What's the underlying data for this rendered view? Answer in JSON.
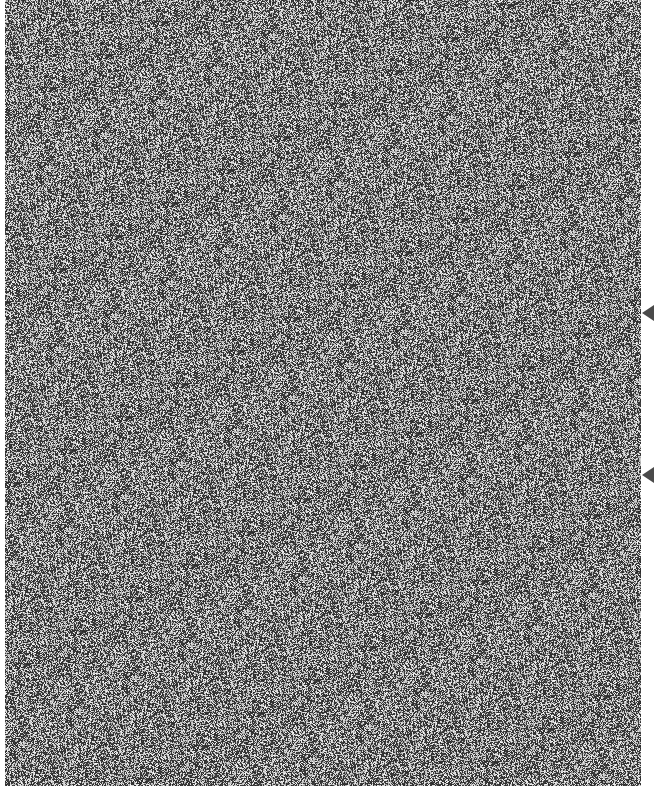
{
  "canvas": {
    "width": 654,
    "height": 803,
    "background_color": "#ffffff"
  },
  "noise_field": {
    "x": 5,
    "y": 0,
    "width": 636,
    "height": 786,
    "tone_dark": "#2e2e2e",
    "tone_light": "#e6e6e6",
    "legible_text": "none"
  },
  "edge_markers": [
    {
      "icon": "triangle-left-icon",
      "x": 642,
      "y": 305,
      "color": "#4a4a4a"
    },
    {
      "icon": "triangle-left-icon",
      "x": 642,
      "y": 467,
      "color": "#4a4a4a"
    }
  ]
}
